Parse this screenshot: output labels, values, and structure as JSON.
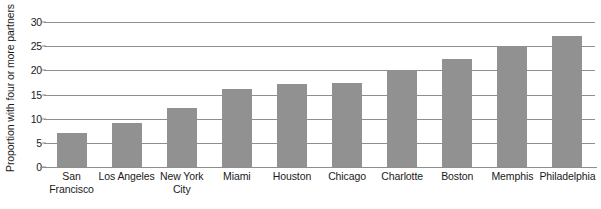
{
  "chart_data": {
    "type": "bar",
    "title": "",
    "xlabel": "",
    "ylabel": "Proportion with four or more partners",
    "ylim": [
      0,
      30
    ],
    "yticks": [
      0,
      5,
      10,
      15,
      20,
      25,
      30
    ],
    "ytick_labels": [
      "0",
      "5",
      "10",
      "15",
      "20",
      "25",
      "30"
    ],
    "grid": true,
    "legend": false,
    "bar_color": "#919191",
    "axis_color": "#8e8e8e",
    "categories": [
      "San Francisco",
      "Los Angeles",
      "New York City",
      "Miami",
      "Houston",
      "Chicago",
      "Charlotte",
      "Boston",
      "Memphis",
      "Philadelphia"
    ],
    "category_lines": [
      [
        "San",
        "Francisco"
      ],
      [
        "Los Angeles",
        ""
      ],
      [
        "New York",
        "City"
      ],
      [
        "Miami",
        ""
      ],
      [
        "Houston",
        ""
      ],
      [
        "Chicago",
        ""
      ],
      [
        "Charlotte",
        ""
      ],
      [
        "Boston",
        ""
      ],
      [
        "Memphis",
        ""
      ],
      [
        "Philadelphia",
        ""
      ]
    ],
    "values": [
      7.0,
      9.2,
      12.2,
      16.2,
      17.2,
      17.4,
      20.0,
      22.3,
      25.1,
      27.1
    ]
  }
}
